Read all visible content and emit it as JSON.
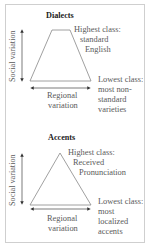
{
  "panels": [
    {
      "title": "Dialects",
      "y_axis_label": "Social variation",
      "x_axis_label": [
        "Regional",
        "variation"
      ],
      "shape": "trapezoid",
      "top_label": [
        "Highest class:",
        "standard",
        "English"
      ],
      "bottom_label": [
        "Lowest class:",
        "most non-",
        "standard",
        "varieties"
      ]
    },
    {
      "title": "Accents",
      "y_axis_label": "Social variation",
      "x_axis_label": [
        "Regional",
        "variation"
      ],
      "shape": "triangle",
      "top_label": [
        "Highest class:",
        "Received",
        "Pronunciation"
      ],
      "bottom_label": [
        "Lowest class:",
        "most",
        "localized",
        "accents"
      ]
    }
  ],
  "colors": {
    "line": "#777777",
    "border": "#cfcfcf",
    "text": "#5a5a5a",
    "title": "#222222"
  }
}
